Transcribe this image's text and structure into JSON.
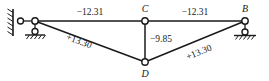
{
  "diagram": {
    "type": "truss-force-diagram",
    "title": "",
    "nodes": [
      {
        "id": "A",
        "label": "",
        "x": 35,
        "y": 21,
        "support": "roller-on-wall"
      },
      {
        "id": "C",
        "label": "C",
        "x": 145,
        "y": 21,
        "support": "none"
      },
      {
        "id": "B",
        "label": "B",
        "x": 245,
        "y": 21,
        "support": "roller"
      },
      {
        "id": "D",
        "label": "D",
        "x": 145,
        "y": 62,
        "support": "none"
      }
    ],
    "members": [
      {
        "id": "AC",
        "from": "A",
        "to": "C",
        "force": "−12.31",
        "sign": "compression"
      },
      {
        "id": "CB",
        "from": "C",
        "to": "B",
        "force": "−12.31",
        "sign": "compression"
      },
      {
        "id": "CD",
        "from": "C",
        "to": "D",
        "force": "−9.85",
        "sign": "compression"
      },
      {
        "id": "AD",
        "from": "A",
        "to": "D",
        "force": "+13.30",
        "sign": "tension"
      },
      {
        "id": "DB",
        "from": "D",
        "to": "B",
        "force": "+13.30",
        "sign": "tension"
      }
    ],
    "labels": {
      "top_left_force": "−12.31",
      "top_right_force": "−12.31",
      "vertical_force": "−9.85",
      "left_diagonal_force": "+13.30",
      "right_diagonal_force": "+13.30",
      "node_c": "C",
      "node_b": "B",
      "node_d": "D"
    },
    "colors": {
      "line": "#1a1a1a",
      "background": "#ffffff",
      "joint_fill": "#ffffff"
    },
    "supports": {
      "left": {
        "kind": "wall-pin-roller",
        "description": "hatched vertical wall with pin and roller"
      },
      "right": {
        "kind": "roller",
        "description": "roller on hatched ground"
      }
    }
  }
}
